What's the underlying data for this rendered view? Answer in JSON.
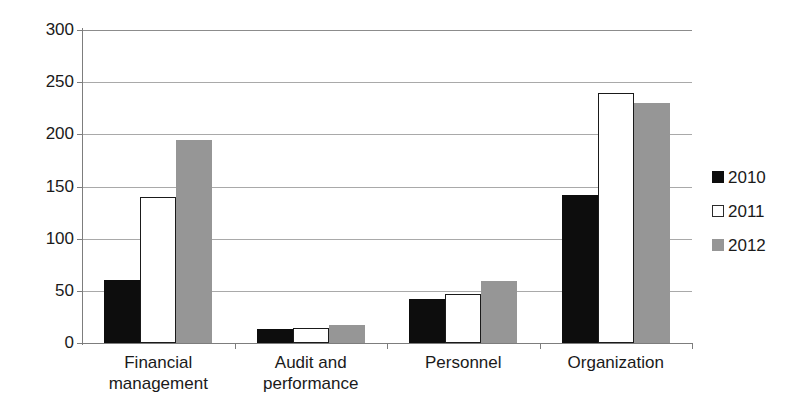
{
  "chart_data": {
    "type": "bar",
    "title": "",
    "xlabel": "",
    "ylabel": "",
    "ylim": [
      0,
      300
    ],
    "ytick_values": [
      300,
      250,
      200,
      150,
      100,
      50,
      0
    ],
    "ytick_labels": [
      "300",
      "250",
      "200",
      "150",
      "100",
      "50",
      "0"
    ],
    "grid": true,
    "legend_position": "right",
    "categories": [
      "Financial management",
      "Audit and performance",
      "Personnel",
      "Organization"
    ],
    "category_lines": [
      [
        "Financial",
        "management"
      ],
      [
        "Audit and",
        "performance"
      ],
      [
        "Personnel"
      ],
      [
        "Organization"
      ]
    ],
    "series": [
      {
        "name": "2010",
        "color": "#0d0d0d",
        "values": [
          60,
          13,
          42,
          142
        ]
      },
      {
        "name": "2011",
        "color": "#ffffff",
        "values": [
          140,
          14,
          47,
          240
        ]
      },
      {
        "name": "2012",
        "color": "#969696",
        "values": [
          195,
          17,
          59,
          230
        ]
      }
    ]
  },
  "legend": {
    "items": [
      {
        "label": "2010"
      },
      {
        "label": "2011"
      },
      {
        "label": "2012"
      }
    ]
  }
}
